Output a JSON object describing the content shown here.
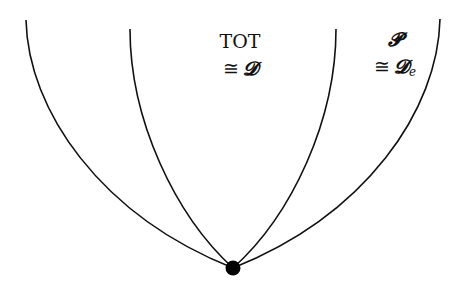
{
  "diagram": {
    "regions": [
      {
        "id": "tot",
        "title": "TOT",
        "equiv_symbol": "≅",
        "equiv_target": "𝓓",
        "equiv_subscript": ""
      },
      {
        "id": "p",
        "title": "𝓟",
        "equiv_symbol": "≅",
        "equiv_target": "𝓓",
        "equiv_subscript": "e"
      }
    ],
    "vertex": {
      "shape": "filled-circle",
      "color": "#000000"
    },
    "curves": 4,
    "stroke_color": "#111111"
  }
}
